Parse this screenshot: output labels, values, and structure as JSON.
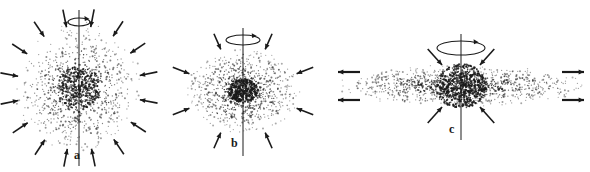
{
  "figure": {
    "type": "scientific-diagram",
    "background_color": "#ffffff",
    "ink_color": "#1a1a1a",
    "width": 590,
    "height": 172
  },
  "panels": [
    {
      "id": "a",
      "label": "a",
      "label_x": 74,
      "label_y": 149,
      "stage": "spherical-cloud",
      "center_x": 79,
      "center_y": 88,
      "cloud_radius_x": 61,
      "cloud_radius_y": 62,
      "core_radius_x": 22,
      "core_radius_y": 22,
      "dot_count": 1500,
      "core_dot_count": 260,
      "axis_top": 10,
      "axis_bottom": 166,
      "axis_x": 79,
      "spin_cx": 79,
      "spin_cy": 22,
      "spin_rx": 11,
      "spin_ry": 4,
      "inward_arrow_count": 16,
      "inward_arrow_start_radius": 80,
      "inward_arrow_end_radius": 62,
      "outward_arrows": []
    },
    {
      "id": "b",
      "label": "b",
      "label_x": 231,
      "label_y": 137,
      "stage": "flattening-cloud",
      "center_x": 243,
      "center_y": 91,
      "cloud_radius_x": 55,
      "cloud_radius_y": 42,
      "core_radius_x": 15,
      "core_radius_y": 12,
      "dot_count": 1400,
      "core_dot_count": 330,
      "axis_top": 28,
      "axis_bottom": 156,
      "axis_x": 243,
      "spin_cx": 243,
      "spin_cy": 40,
      "spin_rx": 17,
      "spin_ry": 5,
      "inward_arrow_count": 8,
      "inward_arrow_start_radius_x": 76,
      "inward_arrow_start_radius_y": 62,
      "inward_arrow_end_radius_x": 58,
      "inward_arrow_end_radius_y": 45,
      "outward_arrows": []
    },
    {
      "id": "c",
      "label": "c",
      "label_x": 449,
      "label_y": 123,
      "stage": "disk-formation",
      "center_x": 461,
      "center_y": 86,
      "cloud_radius_x": 122,
      "cloud_radius_y": 20,
      "core_radius_x": 26,
      "core_radius_y": 22,
      "dot_count": 1700,
      "core_dot_count": 520,
      "axis_top": 34,
      "axis_bottom": 140,
      "axis_x": 461,
      "spin_cx": 461,
      "spin_cy": 48,
      "spin_rx": 24,
      "spin_ry": 7,
      "inward_arrow_count": 4,
      "inward_arrow_angles": [
        235,
        305,
        55,
        125
      ],
      "inward_arrow_start_radius": 58,
      "inward_arrow_end_radius": 33,
      "outward_arrows": [
        {
          "x1": 360,
          "y1": 72,
          "x2": 338,
          "y2": 72,
          "dir": "left"
        },
        {
          "x1": 360,
          "y1": 100,
          "x2": 338,
          "y2": 100,
          "dir": "left"
        },
        {
          "x1": 562,
          "y1": 72,
          "x2": 584,
          "y2": 72,
          "dir": "right"
        },
        {
          "x1": 562,
          "y1": 100,
          "x2": 584,
          "y2": 100,
          "dir": "right"
        }
      ]
    }
  ],
  "legend": {
    "rotation_indicator": "curved-arrow-around-axis",
    "arrow_meaning_inward": "gravitational infall",
    "arrow_meaning_outward": "centrifugal outflow in equatorial plane"
  }
}
